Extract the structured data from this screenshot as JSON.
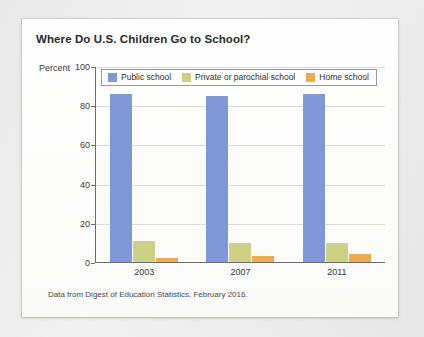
{
  "chart_data": {
    "type": "bar",
    "title": "Where Do U.S. Children Go to School?",
    "xlabel": "",
    "ylabel": "Percent",
    "ylim": [
      0,
      100
    ],
    "yticks": [
      0,
      20,
      40,
      60,
      80,
      100
    ],
    "grid": true,
    "legend_position": "top-left-inside",
    "categories": [
      "2003",
      "2007",
      "2011"
    ],
    "series": [
      {
        "name": "Public school",
        "color": "#8198d8",
        "values": [
          86,
          85,
          86
        ]
      },
      {
        "name": "Private or parochial school",
        "color": "#ccd186",
        "values": [
          11,
          10,
          10
        ]
      },
      {
        "name": "Home school",
        "color": "#f0a953",
        "values": [
          2,
          3,
          4
        ]
      }
    ],
    "source_note": "Data from Digest of Education Statistics, February 2016."
  }
}
